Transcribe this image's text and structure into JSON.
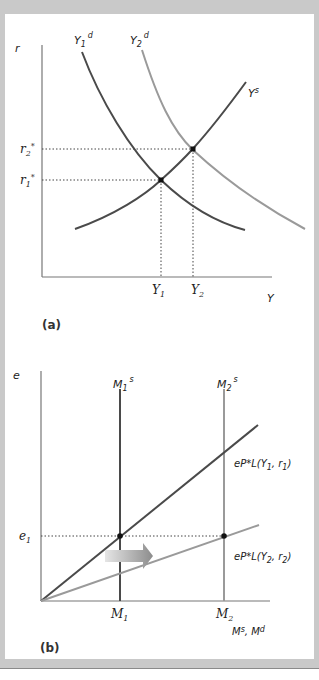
{
  "panel_a": {
    "caption": "(a)",
    "y_axis_label": "r",
    "x_axis_label": "Y",
    "curves": {
      "y1d": {
        "name": "Y",
        "sub": "1",
        "sup": "d",
        "color": "#4a4a4a"
      },
      "y2d": {
        "name": "Y",
        "sub": "2",
        "sup": "d",
        "color": "#9a9a9a"
      },
      "ys": {
        "name": "Y",
        "sup": "s",
        "color": "#4a4a4a"
      }
    },
    "ticks_x": [
      {
        "name": "Y",
        "sub": "1"
      },
      {
        "name": "Y",
        "sub": "2"
      }
    ],
    "ticks_y": [
      {
        "name": "r",
        "sub": "2",
        "sup": "*"
      },
      {
        "name": "r",
        "sub": "1",
        "sup": "*"
      }
    ]
  },
  "panel_b": {
    "caption": "(b)",
    "y_axis_label": "e",
    "x_axis_label": "Ms, Md",
    "x_axis_label_parts": {
      "m1": "M",
      "s": "s",
      "sep": ", ",
      "m2": "M",
      "d": "d"
    },
    "vertical_lines": [
      {
        "name": "M",
        "sub": "1",
        "sup": "s",
        "color": "#4a4a4a"
      },
      {
        "name": "M",
        "sub": "2",
        "sup": "s",
        "color": "#9a9a9a"
      }
    ],
    "demand_lines": [
      {
        "prefix": "eP*L(Y",
        "sub1": "1",
        "mid": ", r",
        "sup2": "*",
        "sub2": "1",
        "suffix": ")",
        "color": "#4a4a4a"
      },
      {
        "prefix": "eP*L(Y",
        "sub1": "2",
        "mid": ", r",
        "sup2": "*",
        "sub2": "2",
        "suffix": ")",
        "color": "#9a9a9a"
      }
    ],
    "ticks_x": [
      {
        "name": "M",
        "sub": "1"
      },
      {
        "name": "M",
        "sub": "2"
      }
    ],
    "ticks_y": [
      {
        "name": "e",
        "sub": "1"
      }
    ],
    "arrow": "shift-right"
  }
}
